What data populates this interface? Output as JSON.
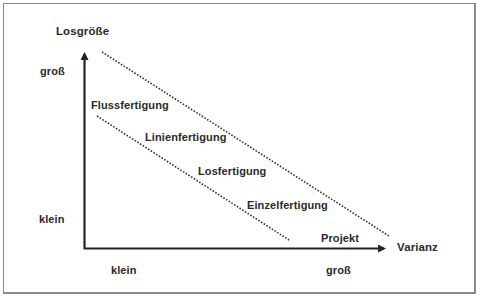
{
  "diagram": {
    "y_axis": {
      "title": "Losgröße",
      "high_label": "groß",
      "low_label": "klein"
    },
    "x_axis": {
      "title": "Varianz",
      "low_label": "klein",
      "high_label": "groß"
    },
    "production_types": [
      {
        "label": "Flussfertigung"
      },
      {
        "label": "Linienfertigung"
      },
      {
        "label": "Losfertigung"
      },
      {
        "label": "Einzelfertigung"
      },
      {
        "label": "Projekt"
      }
    ],
    "colors": {
      "axis": "#222222",
      "text": "#2a2a2a",
      "border": "#8a8a8a"
    }
  }
}
